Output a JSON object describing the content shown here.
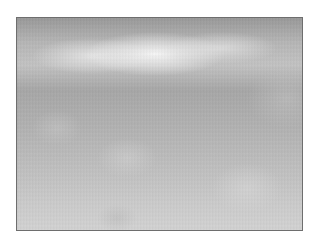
{
  "image": {
    "description": "grayscale blurred texture with bright band near top",
    "colors": {
      "border": "#6e6e6e",
      "highlight": "#fafafa",
      "mid_gray": "#b2b2b2",
      "dark_gray": "#9a9a9a",
      "background": "#ffffff"
    }
  }
}
